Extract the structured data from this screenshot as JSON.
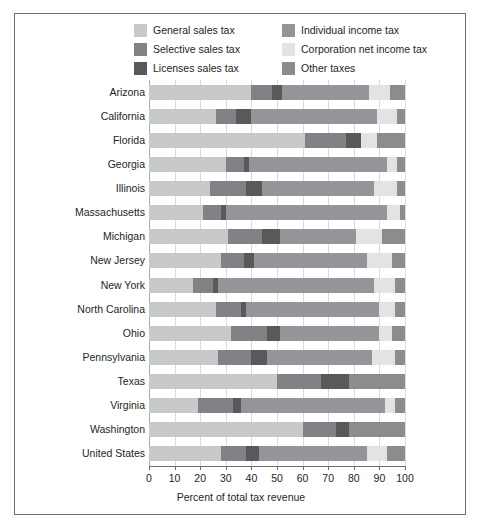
{
  "figure": {
    "background_color": "#ffffff",
    "border_color": "#6d6e71"
  },
  "legend": {
    "items": [
      {
        "label": "General sales tax",
        "key": "general_sales",
        "color": "#c8c9ca"
      },
      {
        "label": "Individual income tax",
        "key": "individual_income",
        "color": "#939598"
      },
      {
        "label": "Selective sales tax",
        "key": "selective_sales",
        "color": "#808285"
      },
      {
        "label": "Corporation net income tax",
        "key": "corporation_net",
        "color": "#e2e3e4"
      },
      {
        "label": "Licenses sales tax",
        "key": "licenses_sales",
        "color": "#58595b"
      },
      {
        "label": "Other taxes",
        "key": "other_taxes",
        "color": "#8a8c8e"
      }
    ],
    "order": [
      "general_sales",
      "selective_sales",
      "licenses_sales",
      "individual_income",
      "corporation_net",
      "other_taxes"
    ]
  },
  "chart_data": {
    "type": "bar",
    "orientation": "horizontal",
    "stacked": true,
    "normalized": true,
    "title": "",
    "xlabel": "Percent of total tax revenue",
    "ylabel": "",
    "xlim": [
      0,
      100
    ],
    "xticks": [
      0,
      10,
      20,
      30,
      40,
      50,
      60,
      70,
      80,
      90,
      100
    ],
    "xticklabels": [
      "0",
      "10",
      "20",
      "30",
      "40",
      "50",
      "60",
      "70",
      "80",
      "90",
      "100"
    ],
    "grid": "vertical",
    "legend_position": "top",
    "categories": [
      "Arizona",
      "California",
      "Florida",
      "Georgia",
      "Illinois",
      "Massachusetts",
      "Michigan",
      "New Jersey",
      "New York",
      "North Carolina",
      "Ohio",
      "Pennsylvania",
      "Texas",
      "Virginia",
      "Washington",
      "United States"
    ],
    "series": [
      {
        "name": "General sales tax",
        "key": "general_sales",
        "color": "#c8c9ca",
        "values": [
          40.0,
          26.0,
          61.0,
          30.0,
          24.0,
          21.0,
          31.0,
          28.0,
          17.0,
          26.0,
          32.0,
          27.0,
          50.0,
          19.0,
          60.0,
          28.0
        ]
      },
      {
        "name": "Selective sales tax",
        "key": "selective_sales",
        "color": "#808285",
        "values": [
          8.0,
          8.0,
          16.0,
          7.0,
          14.0,
          7.0,
          13.0,
          9.0,
          8.0,
          10.0,
          14.0,
          13.0,
          17.0,
          14.0,
          13.0,
          10.0
        ]
      },
      {
        "name": "Licenses sales tax",
        "key": "licenses_sales",
        "color": "#58595b",
        "values": [
          4.0,
          6.0,
          6.0,
          2.0,
          6.0,
          2.0,
          7.0,
          4.0,
          2.0,
          2.0,
          5.0,
          6.0,
          11.0,
          3.0,
          5.0,
          5.0
        ]
      },
      {
        "name": "Individual income tax",
        "key": "individual_income",
        "color": "#939598",
        "values": [
          34.0,
          49.0,
          0.0,
          54.0,
          44.0,
          63.0,
          30.0,
          44.0,
          61.0,
          52.0,
          39.0,
          41.0,
          0.0,
          56.0,
          0.0,
          42.0
        ]
      },
      {
        "name": "Corporation net income tax",
        "key": "corporation_net",
        "color": "#e2e3e4",
        "values": [
          8.0,
          8.0,
          6.0,
          4.0,
          9.0,
          5.0,
          10.0,
          10.0,
          8.0,
          6.0,
          5.0,
          9.0,
          0.0,
          4.0,
          0.0,
          8.0
        ]
      },
      {
        "name": "Other taxes",
        "key": "other_taxes",
        "color": "#8a8c8e",
        "values": [
          6.0,
          3.0,
          11.0,
          3.0,
          3.0,
          2.0,
          9.0,
          5.0,
          4.0,
          4.0,
          5.0,
          4.0,
          22.0,
          4.0,
          22.0,
          7.0
        ]
      }
    ]
  }
}
